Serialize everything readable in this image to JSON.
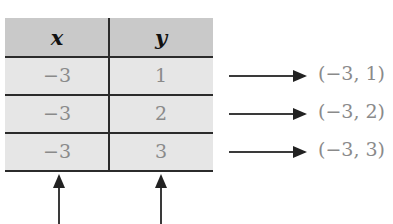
{
  "table": {
    "headers": [
      "x",
      "y"
    ],
    "rows": [
      [
        "−3",
        "1"
      ],
      [
        "−3",
        "2"
      ],
      [
        "−3",
        "3"
      ]
    ]
  },
  "ordered_pairs": [
    "(−3, 1)",
    "(−3, 2)",
    "(−3, 3)"
  ],
  "colors": {
    "header_bg": "#c9c9c9",
    "row_bg": "#e6e6e6",
    "value_text": "#8a8a8a",
    "lines": "#2b2b2b"
  }
}
